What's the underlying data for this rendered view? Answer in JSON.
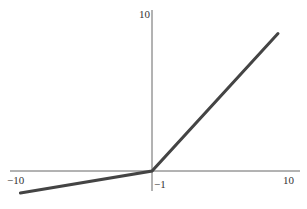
{
  "chart_data": {
    "type": "line",
    "title": "",
    "xlabel": "",
    "ylabel": "",
    "xlim": [
      -10,
      10
    ],
    "ylim": [
      -1,
      10
    ],
    "grid": false,
    "legend": null,
    "tick_labels": {
      "x_min": "−10",
      "x_max": "10",
      "y_max": "10",
      "y_min": "−1"
    },
    "series": [
      {
        "name": "leaky ReLU",
        "x": [
          -9.4,
          0,
          9
        ],
        "y": [
          -1.4,
          0,
          8.7
        ]
      }
    ],
    "line_color": "#444444",
    "axis_color": "#555555"
  }
}
